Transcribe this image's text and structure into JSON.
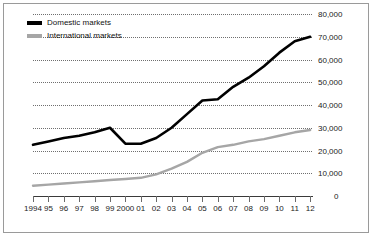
{
  "chart_data": {
    "type": "line",
    "title": "",
    "xlabel": "",
    "ylabel": "",
    "grid": true,
    "legend_position": "top-left",
    "ylim": [
      0,
      80000
    ],
    "yticks": [
      0,
      10000,
      20000,
      30000,
      40000,
      50000,
      60000,
      70000,
      80000
    ],
    "ytick_labels": [
      "0",
      "10,000",
      "20,000",
      "30,000",
      "40,000",
      "50,000",
      "60,000",
      "70,000",
      "80,000"
    ],
    "categories": [
      "1994",
      "95",
      "96",
      "97",
      "98",
      "99",
      "2000",
      "01",
      "02",
      "03",
      "04",
      "05",
      "06",
      "07",
      "08",
      "09",
      "10",
      "11",
      "12"
    ],
    "series": [
      {
        "name": "Domestic markets",
        "color": "#000000",
        "values": [
          22500,
          24000,
          25500,
          26500,
          28000,
          30000,
          23000,
          23000,
          25500,
          30000,
          36000,
          42000,
          42500,
          48000,
          52000,
          57000,
          63000,
          68000,
          70000
        ]
      },
      {
        "name": "International markets",
        "color": "#a6a6a6",
        "values": [
          4500,
          5000,
          5500,
          6000,
          6500,
          7000,
          7500,
          8000,
          9500,
          12000,
          15000,
          19000,
          21500,
          22500,
          24000,
          25000,
          26500,
          28000,
          29000
        ]
      }
    ]
  },
  "legend": {
    "items": [
      {
        "label": "Domestic markets",
        "color": "#000000"
      },
      {
        "label": "International markets",
        "color": "#a6a6a6"
      }
    ]
  },
  "colors": {
    "domestic": "#000000",
    "international": "#a6a6a6",
    "gridline": "#6f6f6f",
    "axis": "#3a3a3a",
    "border": "#9a9a9a",
    "background": "#ffffff"
  }
}
